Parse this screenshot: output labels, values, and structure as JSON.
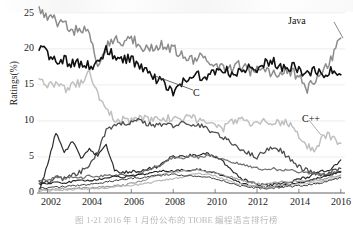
{
  "chart_data": {
    "type": "line",
    "title": "",
    "xlabel": "",
    "ylabel": "Ratings(%)",
    "xlim": [
      2001.5,
      2016.2
    ],
    "ylim": [
      0,
      26.5
    ],
    "grid": true,
    "grid_axis": "y",
    "legend": "none",
    "annotations": [
      {
        "text": "Java",
        "x": 2015.2,
        "y": 23.6
      },
      {
        "text": "C",
        "x": 2008.6,
        "y": 13.9
      },
      {
        "text": "C++",
        "x": 2015.6,
        "y": 10.3
      }
    ],
    "yticks": [
      0,
      5,
      10,
      15,
      20,
      25
    ],
    "xticks": [
      2002,
      2004,
      2006,
      2008,
      2010,
      2012,
      2014,
      2016
    ],
    "x": [
      2001.6,
      2002.0,
      2002.4,
      2002.8,
      2003.2,
      2003.6,
      2004.0,
      2004.4,
      2004.8,
      2005.2,
      2005.6,
      2006.0,
      2006.4,
      2006.8,
      2007.2,
      2007.6,
      2008.0,
      2008.4,
      2008.8,
      2009.2,
      2009.6,
      2010.0,
      2010.4,
      2010.8,
      2011.2,
      2011.6,
      2012.0,
      2012.4,
      2012.8,
      2013.2,
      2013.6,
      2014.0,
      2014.4,
      2014.8,
      2015.2,
      2015.6,
      2016.0
    ],
    "series": [
      {
        "name": "Java",
        "color": "#8c8c8c",
        "width": 1.5,
        "values": [
          25.4,
          24.6,
          23.8,
          23.4,
          22.6,
          22.8,
          22.0,
          17.5,
          20.4,
          21.3,
          21.0,
          21.5,
          20.6,
          19.8,
          20.2,
          20.6,
          20.0,
          19.4,
          18.5,
          18.8,
          18.2,
          17.7,
          17.4,
          17.2,
          17.8,
          17.0,
          16.9,
          17.3,
          16.6,
          17.1,
          16.8,
          16.3,
          14.2,
          15.9,
          17.1,
          19.0,
          21.5
        ]
      },
      {
        "name": "C",
        "color": "#111111",
        "width": 1.6,
        "values": [
          20.1,
          19.3,
          18.6,
          18.4,
          17.9,
          18.2,
          17.5,
          18.3,
          19.8,
          19.0,
          18.7,
          18.4,
          17.6,
          16.7,
          15.9,
          15.2,
          14.1,
          15.4,
          15.8,
          16.2,
          16.1,
          16.9,
          17.4,
          16.2,
          16.8,
          17.6,
          16.4,
          17.9,
          18.1,
          17.2,
          17.6,
          17.1,
          16.4,
          17.1,
          16.5,
          17.0,
          16.4
        ]
      },
      {
        "name": "C++",
        "color": "#c0c0c0",
        "width": 1.5,
        "values": [
          15.7,
          14.8,
          15.1,
          14.4,
          14.9,
          15.3,
          16.6,
          13.5,
          12.0,
          10.3,
          10.1,
          9.9,
          10.4,
          10.1,
          10.2,
          10.4,
          10.1,
          10.3,
          10.5,
          10.2,
          9.8,
          9.3,
          9.0,
          9.9,
          10.4,
          9.8,
          9.7,
          9.9,
          9.6,
          9.9,
          9.3,
          8.1,
          6.5,
          5.6,
          8.1,
          7.6,
          6.9
        ]
      },
      {
        "name": "Visual Basic",
        "color": "#4d4d4d",
        "width": 1.3,
        "values": [
          1.7,
          1.4,
          2.2,
          2.0,
          2.4,
          2.9,
          3.9,
          5.6,
          8.8,
          9.2,
          9.6,
          9.9,
          10.2,
          9.5,
          9.4,
          9.6,
          9.3,
          9.8,
          9.2,
          9.5,
          8.9,
          8.4,
          7.6,
          6.9,
          6.2,
          5.5,
          5.0,
          5.9,
          6.4,
          5.8,
          4.6,
          3.6,
          3.1,
          2.7,
          2.4,
          2.9,
          3.4
        ]
      },
      {
        "name": "C#",
        "color": "#2b2b2b",
        "width": 1.2,
        "values": [
          0.4,
          3.8,
          8.4,
          5.6,
          7.2,
          4.8,
          6.0,
          5.1,
          6.8,
          3.1,
          2.8,
          3.0,
          2.9,
          3.4,
          3.6,
          4.4,
          5.1,
          5.0,
          5.2,
          5.3,
          5.4,
          5.0,
          4.3,
          3.0,
          2.1,
          1.6,
          1.2,
          1.0,
          1.1,
          1.3,
          1.5,
          1.9,
          2.2,
          2.6,
          3.1,
          3.4,
          4.6
        ]
      },
      {
        "name": "Python",
        "color": "#6e6e6e",
        "width": 1.2,
        "values": [
          1.8,
          1.9,
          2.1,
          2.0,
          2.2,
          2.1,
          2.4,
          2.3,
          2.5,
          2.4,
          2.6,
          2.4,
          2.7,
          3.2,
          3.6,
          4.2,
          5.0,
          4.8,
          5.1,
          4.9,
          5.2,
          5.0,
          4.7,
          4.3,
          4.0,
          3.7,
          3.5,
          3.2,
          3.4,
          3.1,
          3.3,
          2.9,
          2.8,
          2.6,
          2.5,
          2.8,
          3.0
        ]
      },
      {
        "name": "PHP",
        "color": "#1f1f1f",
        "width": 1.1,
        "values": [
          1.2,
          1.3,
          1.5,
          1.4,
          1.6,
          1.8,
          1.7,
          1.9,
          2.1,
          2.3,
          2.2,
          2.4,
          2.5,
          2.7,
          2.9,
          3.1,
          3.0,
          3.2,
          3.1,
          3.3,
          3.0,
          2.8,
          2.4,
          1.9,
          1.4,
          1.1,
          0.9,
          0.8,
          0.9,
          1.0,
          1.2,
          1.4,
          1.7,
          2.0,
          2.3,
          2.6,
          2.9
        ]
      },
      {
        "name": "JavaScript",
        "color": "#9a9a9a",
        "width": 1.1,
        "values": [
          0.5,
          0.5,
          0.6,
          0.6,
          0.6,
          0.7,
          0.7,
          0.8,
          0.9,
          1.0,
          1.1,
          1.3,
          1.6,
          2.0,
          2.4,
          2.7,
          2.9,
          3.0,
          3.1,
          3.2,
          3.0,
          2.8,
          2.5,
          2.2,
          1.8,
          1.5,
          1.3,
          1.2,
          1.4,
          1.6,
          1.5,
          1.7,
          1.6,
          1.8,
          2.0,
          2.2,
          2.5
        ]
      },
      {
        "name": "Perl",
        "color": "#b5b5b5",
        "width": 1.1,
        "values": [
          0.3,
          0.35,
          0.4,
          0.45,
          0.5,
          0.55,
          0.6,
          0.65,
          0.7,
          0.8,
          0.9,
          1.0,
          1.2,
          1.4,
          1.6,
          1.8,
          2.0,
          2.2,
          2.5,
          2.7,
          2.6,
          2.4,
          2.0,
          1.6,
          1.2,
          1.0,
          0.9,
          0.8,
          0.9,
          1.0,
          1.1,
          1.2,
          1.3,
          1.5,
          1.7,
          1.9,
          2.2
        ]
      },
      {
        "name": "Ruby",
        "color": "#3a3a3a",
        "width": 1.0,
        "values": [
          0.6,
          0.7,
          0.8,
          0.9,
          1.0,
          1.1,
          1.2,
          1.3,
          1.5,
          1.7,
          1.9,
          2.0,
          2.1,
          2.3,
          2.4,
          2.5,
          2.6,
          2.5,
          2.4,
          2.3,
          2.2,
          2.0,
          1.7,
          1.3,
          1.0,
          0.8,
          0.7,
          0.6,
          0.7,
          0.8,
          0.9,
          1.0,
          1.1,
          1.3,
          1.5,
          1.8,
          2.1
        ]
      }
    ]
  },
  "axes": {
    "ytick_labels": [
      "25",
      "20",
      "15",
      "10",
      "5",
      "0"
    ],
    "xtick_labels": [
      "2002",
      "2004",
      "2006",
      "2008",
      "2010",
      "2012",
      "2014",
      "2016"
    ],
    "ylabel_text": "Ratings(%)"
  },
  "annotations": {
    "java": "Java",
    "c": "C",
    "cpp": "C++"
  },
  "caption": {
    "text": "图 1-21   2016 年 1 月份公布的 TIOBE 编程语言排行榜"
  }
}
